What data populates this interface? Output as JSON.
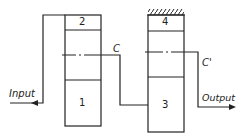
{
  "diagram": {
    "blocks": [
      {
        "id": "1",
        "label": "1"
      },
      {
        "id": "2",
        "label": "2"
      },
      {
        "id": "3",
        "label": "3"
      },
      {
        "id": "4",
        "label": "4"
      }
    ],
    "labels": {
      "input": "Input",
      "output": "Output",
      "c": "C",
      "c_prime": "C'"
    },
    "line_color": "#222222"
  }
}
